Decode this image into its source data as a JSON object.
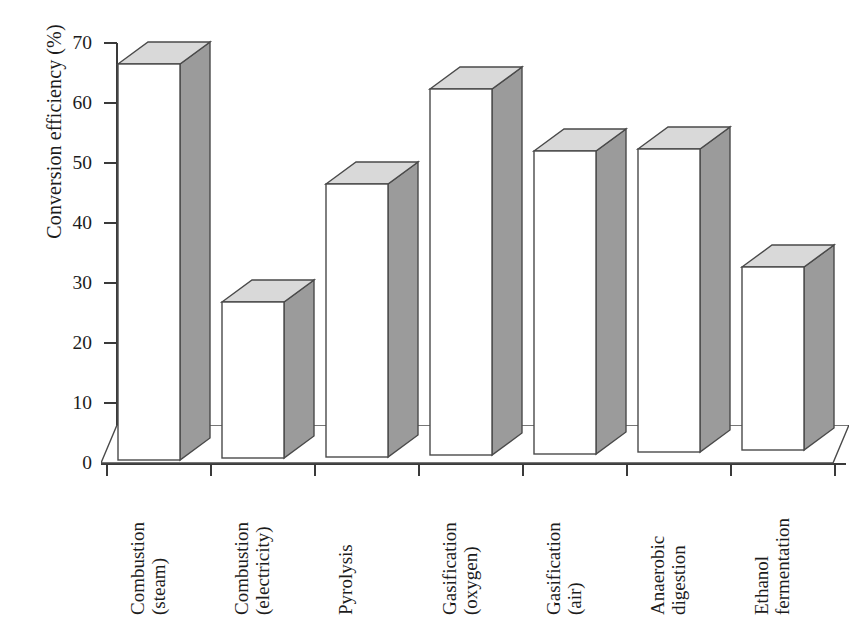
{
  "chart_data": {
    "type": "bar",
    "title": "",
    "xlabel": "",
    "ylabel": "Conversion efficiency (%)",
    "ylim": [
      0,
      70
    ],
    "ytick_step": 10,
    "yticks": [
      70,
      60,
      50,
      40,
      30,
      20,
      10,
      0
    ],
    "ytick_labels": [
      "70",
      "60",
      "50",
      "40",
      "30",
      "20",
      "10",
      "0"
    ],
    "grid": false,
    "legend": "none",
    "style": "3d-bars",
    "categories": [
      "Combustion (steam)",
      "Combustion (electricity)",
      "Pyrolysis",
      "Gasification (oxygen)",
      "Gasification (air)",
      "Anaerobic digestion",
      "Ethanol fermentation"
    ],
    "category_lines": [
      [
        "Combustion",
        "(steam)"
      ],
      [
        "Combustion",
        "(electricity)"
      ],
      [
        "Pyrolysis",
        ""
      ],
      [
        "Gasification",
        "(oxygen)"
      ],
      [
        "Gasification",
        "(air)"
      ],
      [
        "Anaerobic",
        "digestion"
      ],
      [
        "Ethanol",
        "fermentation"
      ]
    ],
    "values": [
      66,
      26,
      45.5,
      61,
      50.5,
      50.5,
      30.5
    ]
  },
  "colors": {
    "bar_front": "#ffffff",
    "bar_side": "#9b9b9b",
    "bar_top": "#d9d9d9",
    "outline": "#4a4a4a",
    "axis": "#3a3a3a",
    "text": "#1c1c1c",
    "background": "#ffffff"
  }
}
